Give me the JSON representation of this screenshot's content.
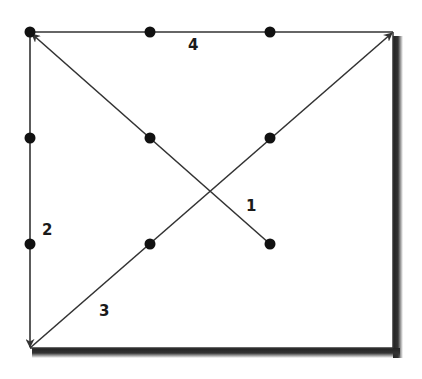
{
  "diagram": {
    "colors": {
      "line": "#333333",
      "dot": "#111111",
      "shadow": "#222222",
      "background": "#ffffff"
    },
    "dots": [
      {
        "x": 30,
        "y": 32
      },
      {
        "x": 150,
        "y": 32
      },
      {
        "x": 270,
        "y": 32
      },
      {
        "x": 30,
        "y": 138
      },
      {
        "x": 150,
        "y": 138
      },
      {
        "x": 270,
        "y": 138
      },
      {
        "x": 30,
        "y": 244
      },
      {
        "x": 150,
        "y": 244
      },
      {
        "x": 270,
        "y": 244
      }
    ],
    "lines": [
      {
        "id": "1",
        "label": "1",
        "from": [
          270,
          244
        ],
        "to": [
          30,
          32
        ]
      },
      {
        "id": "2",
        "label": "2",
        "from": [
          30,
          32
        ],
        "to": [
          30,
          348
        ]
      },
      {
        "id": "3",
        "label": "3",
        "from": [
          30,
          348
        ],
        "to": [
          393,
          32
        ]
      },
      {
        "id": "4",
        "label": "4",
        "from": [
          393,
          32
        ],
        "to": [
          30,
          32
        ]
      }
    ],
    "labels": {
      "l1": "1",
      "l2": "2",
      "l3": "3",
      "l4": "4"
    }
  }
}
